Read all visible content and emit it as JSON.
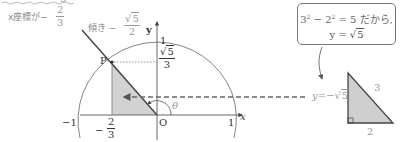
{
  "diagram": {
    "top_cut_label": "3",
    "annotation_x_coord": {
      "prefix": "x座標が−",
      "numerator": "2",
      "denominator": "3"
    },
    "annotation_slope": {
      "prefix": "傾き −",
      "numerator_root": "5",
      "denominator": "2"
    },
    "axis": {
      "y_label": "y",
      "x_label": "x",
      "origin_label": "O",
      "y_one": "1",
      "x_one": "1",
      "x_neg_one": "−1"
    },
    "point": {
      "label": "P",
      "y_value_root": "5",
      "y_value_den": "3",
      "x_value_prefix": "−",
      "x_value_num": "2",
      "x_value_den": "3"
    },
    "angle_label": "θ",
    "callout": {
      "line1_a": "3",
      "line1_b": " − 2",
      "line1_c": " = 5 だから,",
      "exp": "2",
      "line2_prefix": "y = ",
      "line2_root": "5"
    },
    "arrow_label_prefix": "y=",
    "arrow_label_root": "5",
    "ref_triangle": {
      "hypotenuse": "3",
      "base": "2"
    },
    "colors": {
      "shade": "#cfcfcf",
      "line": "#444444",
      "light_line": "#888888",
      "note_text": "#999999"
    }
  }
}
